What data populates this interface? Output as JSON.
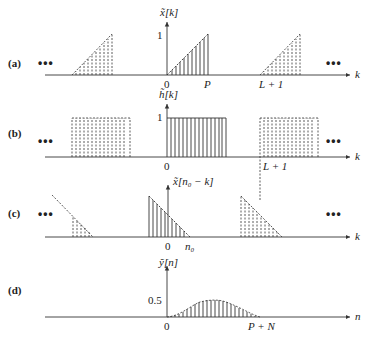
{
  "panels": [
    {
      "id": "a",
      "label": "(a)",
      "y_axis_label": "x̃[k]",
      "y_tick": "1",
      "x_axis_label": "k",
      "x_ticks": [
        "0",
        "P",
        "L + 1"
      ],
      "ellipsis_left": "•••",
      "ellipsis_right": "•••"
    },
    {
      "id": "b",
      "label": "(b)",
      "y_axis_label": "h̃[k]",
      "y_tick": "1",
      "x_axis_label": "k",
      "x_ticks": [
        "0",
        "L + 1"
      ],
      "ellipsis_left": "•••",
      "ellipsis_right": "•••"
    },
    {
      "id": "c",
      "label": "(c)",
      "y_axis_label": "x̃[n₀ − k]",
      "x_axis_label": "k",
      "x_ticks": [
        "0",
        "n₀"
      ],
      "ellipsis_left": "•••",
      "ellipsis_right": "•••"
    },
    {
      "id": "d",
      "label": "(d)",
      "y_axis_label": "ỹ[n]",
      "y_tick": "0.5",
      "x_axis_label": "n",
      "x_ticks": [
        "0",
        "P + N"
      ]
    }
  ],
  "colors": {
    "stroke": "#333333",
    "text": "#222222"
  }
}
